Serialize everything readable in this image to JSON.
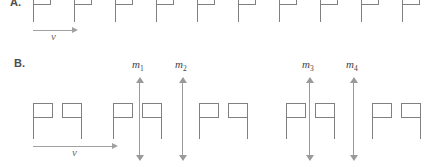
{
  "figure": {
    "width": 442,
    "height": 167,
    "background": "#ffffff",
    "line_color": "#808080",
    "arrow_color": "#9a9a9a",
    "label_color": "#4d4d4d"
  },
  "panels": [
    {
      "id": "panel-a",
      "label": "A.",
      "label_pos": {
        "x": 10,
        "y": -4
      },
      "flag_count": 10,
      "flags": [
        {
          "pole_x": 33,
          "pole_top": -8,
          "pole_height": 30,
          "banner_x": 33,
          "banner_y": -8,
          "banner_w": 18,
          "banner_h": 13,
          "orientation": "flag-right"
        },
        {
          "pole_x": 74,
          "pole_top": -8,
          "pole_height": 30,
          "banner_x": 74,
          "banner_y": -8,
          "banner_w": 18,
          "banner_h": 13,
          "orientation": "flag-right"
        },
        {
          "pole_x": 115,
          "pole_top": -8,
          "pole_height": 30,
          "banner_x": 115,
          "banner_y": -8,
          "banner_w": 18,
          "banner_h": 13,
          "orientation": "flag-right"
        },
        {
          "pole_x": 156,
          "pole_top": -8,
          "pole_height": 30,
          "banner_x": 156,
          "banner_y": -8,
          "banner_w": 18,
          "banner_h": 13,
          "orientation": "flag-right"
        },
        {
          "pole_x": 197,
          "pole_top": -8,
          "pole_height": 30,
          "banner_x": 197,
          "banner_y": -8,
          "banner_w": 18,
          "banner_h": 13,
          "orientation": "flag-right"
        },
        {
          "pole_x": 238,
          "pole_top": -8,
          "pole_height": 30,
          "banner_x": 238,
          "banner_y": -8,
          "banner_w": 18,
          "banner_h": 13,
          "orientation": "flag-right"
        },
        {
          "pole_x": 279,
          "pole_top": -8,
          "pole_height": 30,
          "banner_x": 279,
          "banner_y": -8,
          "banner_w": 18,
          "banner_h": 13,
          "orientation": "flag-right"
        },
        {
          "pole_x": 320,
          "pole_top": -8,
          "pole_height": 30,
          "banner_x": 320,
          "banner_y": -8,
          "banner_w": 18,
          "banner_h": 13,
          "orientation": "flag-right"
        },
        {
          "pole_x": 361,
          "pole_top": -8,
          "pole_height": 30,
          "banner_x": 361,
          "banner_y": -8,
          "banner_w": 18,
          "banner_h": 13,
          "orientation": "flag-right"
        },
        {
          "pole_x": 402,
          "pole_top": -8,
          "pole_height": 30,
          "banner_x": 402,
          "banner_y": -8,
          "banner_w": 18,
          "banner_h": 13,
          "orientation": "flag-right"
        }
      ],
      "velocity_arrow": {
        "label": "v",
        "x": 33,
        "y": 26,
        "length": 45,
        "label_x": 51,
        "label_y": 30
      }
    },
    {
      "id": "panel-b",
      "label": "B.",
      "label_pos": {
        "x": 14,
        "y": 57
      },
      "pair_count": 5,
      "flags": [
        {
          "pole_x": 33,
          "pole_top": 103,
          "pole_height": 36,
          "banner_x": 33,
          "banner_y": 103,
          "banner_w": 20,
          "banner_h": 15,
          "orientation": "flag-right"
        },
        {
          "pole_x": 81,
          "pole_top": 103,
          "pole_height": 36,
          "banner_x": 62,
          "banner_y": 103,
          "banner_w": 20,
          "banner_h": 15,
          "orientation": "flag-left"
        },
        {
          "pole_x": 113,
          "pole_top": 103,
          "pole_height": 36,
          "banner_x": 113,
          "banner_y": 103,
          "banner_w": 20,
          "banner_h": 15,
          "orientation": "flag-right"
        },
        {
          "pole_x": 161,
          "pole_top": 103,
          "pole_height": 36,
          "banner_x": 142,
          "banner_y": 103,
          "banner_w": 20,
          "banner_h": 15,
          "orientation": "flag-left"
        },
        {
          "pole_x": 199,
          "pole_top": 103,
          "pole_height": 36,
          "banner_x": 199,
          "banner_y": 103,
          "banner_w": 20,
          "banner_h": 15,
          "orientation": "flag-right"
        },
        {
          "pole_x": 247,
          "pole_top": 103,
          "pole_height": 36,
          "banner_x": 228,
          "banner_y": 103,
          "banner_w": 20,
          "banner_h": 15,
          "orientation": "flag-left"
        },
        {
          "pole_x": 286,
          "pole_top": 103,
          "pole_height": 36,
          "banner_x": 286,
          "banner_y": 103,
          "banner_w": 20,
          "banner_h": 15,
          "orientation": "flag-right"
        },
        {
          "pole_x": 334,
          "pole_top": 103,
          "pole_height": 36,
          "banner_x": 315,
          "banner_y": 103,
          "banner_w": 20,
          "banner_h": 15,
          "orientation": "flag-left"
        },
        {
          "pole_x": 372,
          "pole_top": 103,
          "pole_height": 36,
          "banner_x": 372,
          "banner_y": 103,
          "banner_w": 20,
          "banner_h": 15,
          "orientation": "flag-right"
        },
        {
          "pole_x": 420,
          "pole_top": 103,
          "pole_height": 36,
          "banner_x": 401,
          "banner_y": 103,
          "banner_w": 20,
          "banner_h": 15,
          "orientation": "flag-left"
        }
      ],
      "measurement_arrows": [
        {
          "id": "m1",
          "label": "m",
          "sub": "1",
          "x": 139,
          "top": 78,
          "height": 82,
          "label_x": 132,
          "label_y": 58
        },
        {
          "id": "m2",
          "label": "m",
          "sub": "2",
          "x": 182,
          "top": 78,
          "height": 82,
          "label_x": 175,
          "label_y": 58
        },
        {
          "id": "m3",
          "label": "m",
          "sub": "3",
          "x": 309,
          "top": 78,
          "height": 82,
          "label_x": 302,
          "label_y": 58
        },
        {
          "id": "m4",
          "label": "m",
          "sub": "4",
          "x": 353,
          "top": 78,
          "height": 82,
          "label_x": 346,
          "label_y": 58
        }
      ],
      "velocity_arrow": {
        "label": "v",
        "x": 33,
        "y": 142,
        "length": 85,
        "label_x": 72,
        "label_y": 146
      }
    }
  ]
}
